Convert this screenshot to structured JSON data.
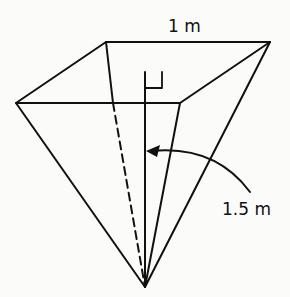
{
  "figure": {
    "type": "inverted square pyramid",
    "labels": {
      "top_edge": "1 m",
      "height": "1.5 m"
    },
    "annotations": {
      "right_angle_marker": true,
      "height_line_dashed_back_edge": true,
      "arrow_to_height": true
    },
    "colors": {
      "stroke": "#111111",
      "background": "#fbfbfa"
    }
  }
}
